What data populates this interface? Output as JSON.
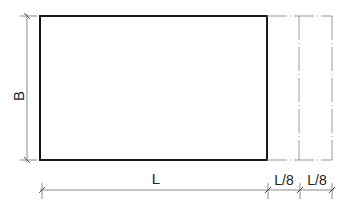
{
  "diagram": {
    "labels": {
      "height": "B",
      "length": "L",
      "offset_1": "L/8",
      "offset_2": "L/8"
    },
    "colors": {
      "outline": "#1a1a1a",
      "dimension_line": "#8a8a8a",
      "centerline": "#9a9a9a",
      "text": "#222222"
    },
    "geometry": {
      "rect": {
        "x1": 40,
        "y1": 16,
        "x2": 267,
        "y2": 160
      },
      "offset_lines_x": [
        299,
        332
      ],
      "vertical_dim_x": 27,
      "horizontal_dim_y": 190,
      "horizontal_dim_ticks_x": [
        42,
        268,
        300,
        332
      ]
    }
  }
}
